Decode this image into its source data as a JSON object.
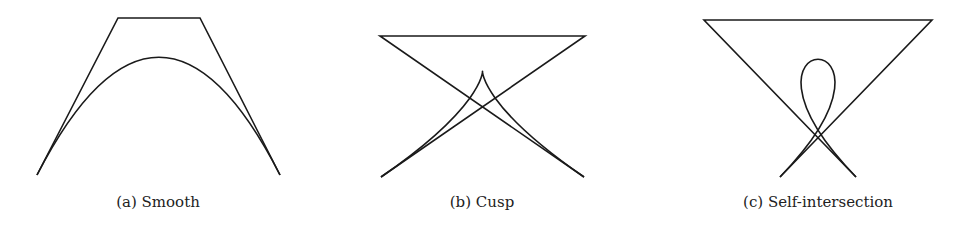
{
  "figure": {
    "panels": [
      {
        "caption": "(a) Smooth",
        "type": "smooth",
        "control_points": [
          [
            37,
            175
          ],
          [
            118,
            18
          ],
          [
            200,
            18
          ],
          [
            280,
            175
          ]
        ],
        "caption_x": 158
      },
      {
        "caption": "(b) Cusp",
        "type": "cusp",
        "control_points": [
          [
            381,
            177
          ],
          [
            585,
            36
          ],
          [
            380,
            36
          ],
          [
            584,
            177
          ]
        ],
        "caption_x": 482
      },
      {
        "caption": "(c) Self-intersection",
        "type": "self-intersection",
        "control_points": [
          [
            780,
            177
          ],
          [
            932,
            20
          ],
          [
            704,
            20
          ],
          [
            856,
            177
          ]
        ],
        "caption_x": 818
      }
    ],
    "stroke_color": "#1a1a1a",
    "background": "#ffffff"
  }
}
